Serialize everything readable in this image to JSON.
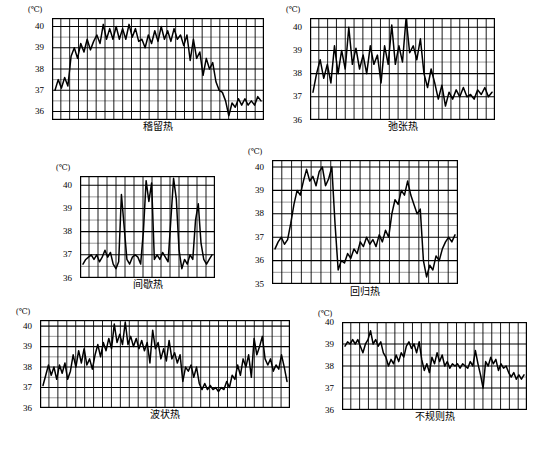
{
  "figure": {
    "unit_symbol": "(℃)",
    "background": "#ffffff",
    "line_color": "#000000",
    "grid_major_color": "#000000",
    "grid_minor_color": "#555555"
  },
  "chart_data": [
    {
      "id": "sustained-fever",
      "type": "line",
      "title": "稽留热",
      "xlabel": "",
      "ylabel": "(℃)",
      "ylim": [
        35.6,
        40.4
      ],
      "yticks": [
        36,
        37,
        38,
        39,
        40
      ],
      "ytick_labels": [
        "36",
        "37",
        "38",
        "39",
        "40"
      ],
      "grid": true,
      "grid_minor_step": 0.5,
      "grid_vertical_count": 24,
      "legend": "none",
      "values": [
        37.0,
        37.5,
        37.1,
        37.6,
        37.2,
        38.6,
        39.0,
        38.5,
        39.2,
        38.8,
        39.4,
        38.9,
        39.3,
        39.6,
        39.2,
        40.1,
        39.4,
        39.9,
        39.4,
        40.0,
        39.4,
        39.9,
        39.4,
        40.1,
        39.5,
        39.9,
        39.3,
        39.4,
        39.0,
        39.6,
        39.2,
        39.8,
        39.3,
        40.0,
        39.4,
        39.8,
        39.3,
        39.9,
        39.4,
        39.6,
        39.1,
        39.6,
        38.4,
        39.4,
        38.5,
        38.8,
        37.7,
        38.5,
        38.0,
        38.3,
        37.4,
        37.0,
        36.9,
        36.5,
        35.8,
        36.4,
        36.2,
        36.6,
        36.3,
        36.6,
        36.3,
        36.5,
        36.3,
        36.7,
        36.5
      ]
    },
    {
      "id": "remittent-fever",
      "type": "line",
      "title": "弛张热",
      "xlabel": "",
      "ylabel": "(℃)",
      "ylim": [
        36.0,
        40.4
      ],
      "yticks": [
        36,
        37,
        38,
        39,
        40
      ],
      "ytick_labels": [
        "36",
        "37",
        "38",
        "39",
        "40"
      ],
      "grid": true,
      "grid_minor_step": 0.5,
      "grid_vertical_count": 21,
      "legend": "none",
      "values": [
        37.2,
        38.0,
        38.6,
        37.8,
        38.4,
        37.6,
        39.2,
        38.0,
        39.0,
        38.2,
        40.0,
        38.4,
        39.1,
        38.2,
        38.8,
        38.0,
        39.2,
        38.4,
        38.8,
        37.6,
        39.2,
        38.4,
        40.1,
        38.4,
        39.2,
        38.5,
        40.4,
        38.9,
        39.2,
        38.6,
        39.5,
        38.0,
        37.4,
        38.2,
        37.6,
        36.9,
        37.5,
        36.6,
        37.2,
        36.9,
        37.3,
        37.0,
        37.4,
        37.0,
        37.1,
        36.9,
        37.3,
        37.1,
        37.4,
        37.0,
        37.2
      ]
    },
    {
      "id": "intermittent-fever",
      "type": "line",
      "title": "间歇热",
      "xlabel": "",
      "ylabel": "(℃)",
      "ylim": [
        36.0,
        40.4
      ],
      "yticks": [
        36,
        37,
        38,
        39,
        40
      ],
      "ytick_labels": [
        "36",
        "37",
        "38",
        "39",
        "40"
      ],
      "grid": true,
      "grid_minor_step": 0.5,
      "grid_vertical_count": 15,
      "legend": "none",
      "values": [
        36.6,
        36.8,
        36.9,
        37.0,
        36.8,
        37.0,
        36.7,
        36.9,
        37.2,
        36.9,
        37.1,
        36.6,
        36.4,
        36.7,
        39.6,
        38.2,
        36.8,
        36.6,
        36.9,
        37.0,
        36.9,
        36.6,
        38.0,
        40.2,
        39.3,
        40.1,
        36.8,
        37.0,
        36.8,
        37.1,
        36.9,
        36.7,
        38.5,
        40.3,
        39.4,
        37.2,
        36.4,
        36.8,
        36.6,
        37.0,
        36.8,
        38.5,
        39.2,
        37.5,
        36.8,
        36.6,
        36.8,
        37.0
      ]
    },
    {
      "id": "relapsing-fever",
      "type": "line",
      "title": "回归热",
      "xlabel": "",
      "ylabel": "(℃)",
      "ylim": [
        35.0,
        40.3
      ],
      "yticks": [
        35,
        36,
        37,
        38,
        39,
        40
      ],
      "ytick_labels": [
        "35",
        "36",
        "37",
        "38",
        "39",
        "40"
      ],
      "grid": true,
      "grid_minor_step": 0.5,
      "grid_vertical_count": 19,
      "legend": "none",
      "values": [
        36.5,
        36.8,
        37.0,
        36.7,
        36.9,
        37.6,
        38.4,
        39.0,
        38.8,
        39.4,
        39.9,
        39.4,
        39.6,
        39.2,
        39.8,
        40.0,
        39.2,
        39.5,
        40.0,
        37.6,
        35.6,
        36.0,
        35.9,
        36.3,
        36.1,
        36.5,
        36.3,
        36.8,
        36.6,
        37.0,
        36.7,
        36.9,
        36.6,
        37.1,
        36.8,
        37.3,
        37.0,
        38.0,
        38.6,
        38.4,
        39.0,
        38.8,
        39.4,
        38.8,
        38.4,
        38.0,
        38.2,
        36.0,
        35.3,
        35.8,
        35.6,
        36.2,
        36.0,
        36.5,
        36.8,
        37.0,
        36.8,
        37.1
      ]
    },
    {
      "id": "undulant-fever",
      "type": "line",
      "title": "波状热",
      "xlabel": "",
      "ylabel": "(℃)",
      "ylim": [
        36.0,
        40.3
      ],
      "yticks": [
        36,
        37,
        38,
        39,
        40
      ],
      "ytick_labels": [
        "36",
        "37",
        "38",
        "39",
        "40"
      ],
      "grid": true,
      "grid_minor_step": 0.5,
      "grid_vertical_count": 28,
      "legend": "none",
      "values": [
        37.1,
        37.6,
        38.1,
        37.6,
        38.0,
        37.4,
        38.1,
        37.7,
        38.2,
        37.4,
        37.8,
        38.6,
        38.0,
        38.8,
        38.2,
        38.9,
        38.1,
        38.4,
        37.9,
        38.6,
        39.1,
        38.5,
        39.2,
        38.8,
        39.4,
        38.9,
        40.1,
        39.2,
        39.6,
        39.1,
        40.2,
        39.1,
        39.5,
        39.0,
        39.4,
        38.9,
        39.3,
        38.8,
        39.2,
        38.2,
        39.8,
        38.9,
        39.2,
        38.4,
        38.9,
        38.3,
        39.3,
        38.4,
        38.7,
        38.2,
        38.6,
        37.3,
        38.0,
        37.8,
        38.1,
        37.5,
        38.0,
        37.2,
        36.9,
        37.2,
        36.9,
        37.1,
        36.9,
        37.0,
        36.8,
        37.0,
        36.9,
        37.3,
        37.0,
        37.6,
        37.4,
        38.1,
        37.6,
        38.4,
        38.0,
        38.6,
        37.5,
        39.4,
        38.6,
        39.0,
        39.5,
        38.4,
        38.1,
        38.4,
        37.8,
        38.1,
        37.9,
        38.6,
        38.0,
        37.3
      ]
    },
    {
      "id": "irregular-fever",
      "type": "line",
      "title": "不规则热",
      "xlabel": "",
      "ylabel": "(℃)",
      "ylim": [
        36.0,
        40.0
      ],
      "yticks": [
        36,
        37,
        38,
        39,
        40
      ],
      "ytick_labels": [
        "36",
        "37",
        "38",
        "39",
        "40"
      ],
      "grid": true,
      "grid_minor_step": 0.5,
      "grid_vertical_count": 21,
      "legend": "none",
      "values": [
        38.9,
        39.1,
        39.0,
        39.2,
        39.0,
        39.2,
        38.9,
        38.6,
        39.0,
        39.2,
        39.6,
        39.0,
        39.2,
        38.9,
        39.1,
        38.6,
        38.4,
        38.0,
        38.3,
        38.1,
        38.5,
        38.2,
        38.6,
        38.4,
        38.9,
        39.1,
        38.8,
        39.0,
        38.6,
        39.1,
        38.3,
        37.8,
        38.1,
        37.7,
        38.4,
        38.1,
        38.6,
        38.2,
        38.5,
        38.0,
        38.2,
        37.9,
        38.1,
        38.0,
        38.1,
        37.9,
        38.1,
        38.0,
        37.9,
        38.2,
        38.0,
        38.7,
        38.1,
        37.6,
        37.0,
        38.2,
        38.0,
        38.4,
        38.1,
        38.3,
        37.8,
        38.1,
        37.9,
        38.0,
        37.7,
        37.5,
        37.7,
        37.4,
        37.6,
        37.4,
        37.6
      ]
    }
  ]
}
